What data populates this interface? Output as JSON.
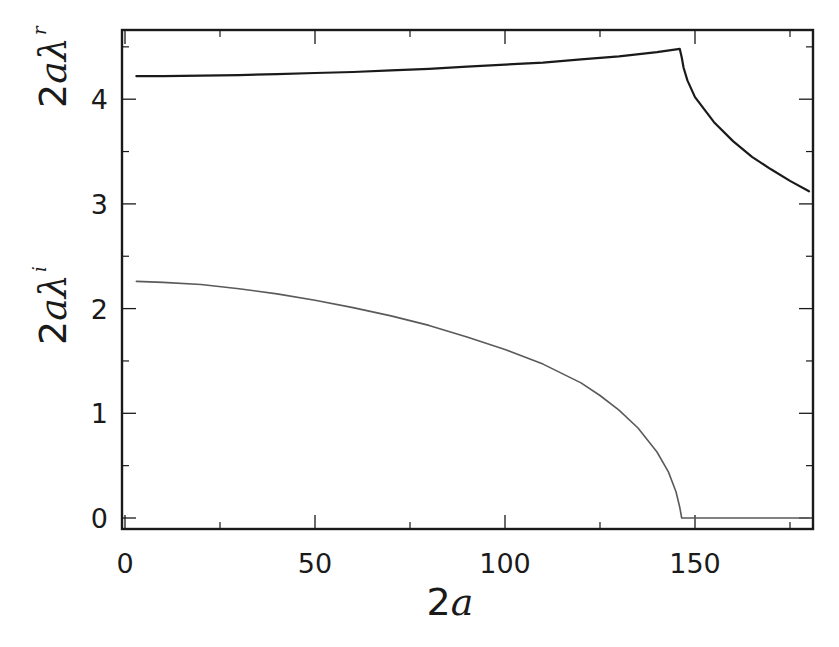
{
  "chart_data": {
    "type": "line",
    "title": "",
    "xlabel": "2a",
    "ylabel_top": "2aλr",
    "ylabel_bottom": "2aλi",
    "xlim": [
      0,
      181
    ],
    "ylim": [
      -0.1,
      4.65
    ],
    "grid": false,
    "legend": "none",
    "x_ticks": [
      0,
      50,
      100,
      150
    ],
    "x_tick_labels": [
      "0",
      "50",
      "100",
      "150"
    ],
    "x_minor_ticks": [
      25,
      75,
      125,
      175
    ],
    "y_ticks": [
      0,
      1,
      2,
      3,
      4
    ],
    "y_tick_labels": [
      "0",
      "1",
      "2",
      "3",
      "4"
    ],
    "y_minor_ticks": [
      0.5,
      1.5,
      2.5,
      3.5,
      4.5
    ],
    "series": [
      {
        "name": "2aλr",
        "color": "#1a1a1a",
        "stroke_width": 2.2,
        "x": [
          3,
          10,
          20,
          30,
          40,
          50,
          60,
          70,
          80,
          90,
          100,
          110,
          120,
          130,
          140,
          146,
          146.5,
          147,
          148,
          150,
          155,
          160,
          165,
          170,
          175,
          180
        ],
        "y": [
          4.22,
          4.22,
          4.225,
          4.23,
          4.24,
          4.25,
          4.26,
          4.275,
          4.29,
          4.31,
          4.33,
          4.35,
          4.38,
          4.41,
          4.45,
          4.48,
          4.4,
          4.3,
          4.18,
          4.02,
          3.78,
          3.6,
          3.45,
          3.33,
          3.22,
          3.12
        ]
      },
      {
        "name": "2aλi",
        "color": "#5a5a5a",
        "stroke_width": 1.6,
        "x": [
          3,
          10,
          20,
          30,
          40,
          50,
          60,
          70,
          80,
          90,
          100,
          110,
          120,
          125,
          130,
          135,
          140,
          143,
          145,
          146,
          146.5,
          150,
          160,
          170,
          180
        ],
        "y": [
          2.26,
          2.25,
          2.23,
          2.19,
          2.14,
          2.08,
          2.01,
          1.93,
          1.84,
          1.73,
          1.61,
          1.47,
          1.29,
          1.17,
          1.03,
          0.86,
          0.63,
          0.44,
          0.25,
          0.1,
          0.0,
          0.0,
          0.0,
          0.0,
          0.0
        ]
      }
    ]
  },
  "layout": {
    "plot_left": 125,
    "plot_right": 813,
    "plot_top": 30,
    "plot_bottom": 529,
    "x_px_per_unit": 3.8,
    "y_zero_px": 518,
    "y_px_per_unit": 104.7
  },
  "labels": {
    "xlabel_main": "2",
    "xlabel_var": "a",
    "ylabel_top_main": "2",
    "ylabel_top_var": "aλ",
    "ylabel_top_sub": "r",
    "ylabel_bottom_main": "2",
    "ylabel_bottom_var": "aλ",
    "ylabel_bottom_sub": "i"
  }
}
